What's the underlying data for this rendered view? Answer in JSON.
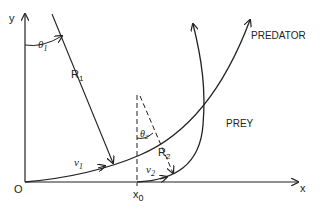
{
  "diagram": {
    "axes": {
      "x_label": "x",
      "y_label": "y",
      "origin_label": "O",
      "x0_label": "x",
      "x0_sub": "0"
    },
    "curves": [
      {
        "name": "PREDATOR",
        "label": "PREDATOR"
      },
      {
        "name": "PREY",
        "label": "PREY"
      }
    ],
    "annotations": {
      "theta1": "θ",
      "theta1_sub": "1",
      "R1": "R",
      "R1_sub": "1",
      "v1": "v",
      "v1_sub": "1",
      "theta2": "θ",
      "theta2_sub": "2",
      "R2": "R",
      "R2_sub": "2",
      "v2": "v",
      "v2_sub": "2"
    },
    "colors": {
      "stroke": "#222222",
      "background": "#ffffff"
    }
  }
}
